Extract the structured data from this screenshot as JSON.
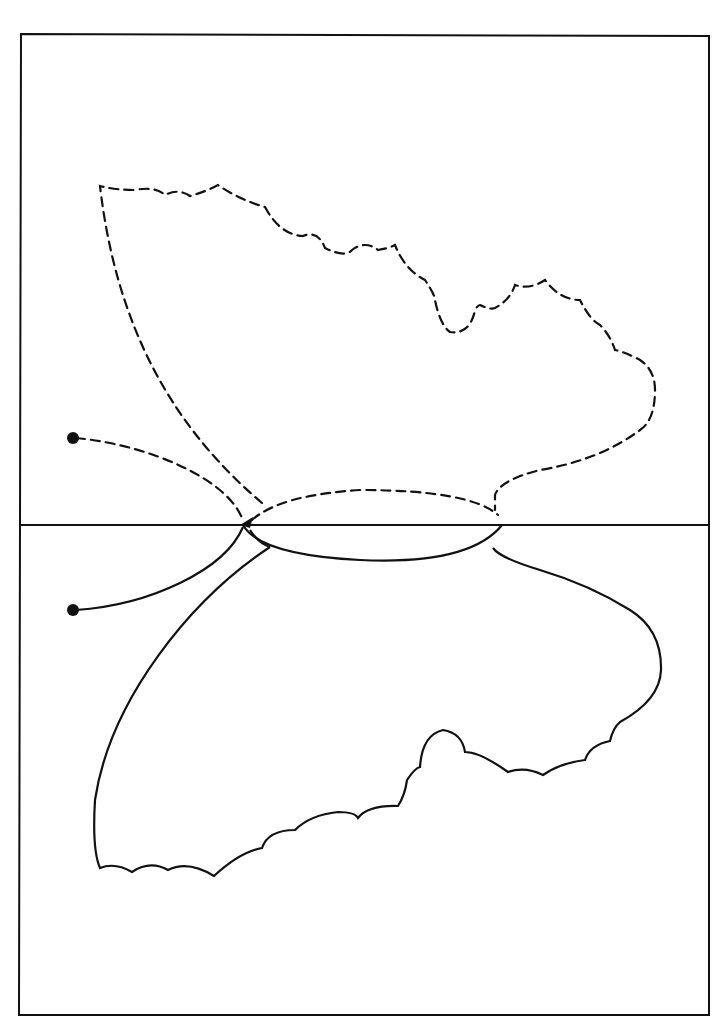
{
  "figure": {
    "colors": {
      "stroke": "#111111",
      "background": "#ffffff"
    },
    "frame": {
      "x": 20,
      "y": 33,
      "width": 689,
      "height": 982
    },
    "mirror_line": {
      "y": 525
    },
    "parts": [
      {
        "name": "upper-wing",
        "style": "dashed"
      },
      {
        "name": "upper-antenna",
        "style": "dashed"
      },
      {
        "name": "upper-body-half",
        "style": "dashed"
      },
      {
        "name": "lower-wing",
        "style": "solid"
      },
      {
        "name": "lower-antenna",
        "style": "solid"
      },
      {
        "name": "lower-body-half",
        "style": "solid"
      }
    ]
  }
}
